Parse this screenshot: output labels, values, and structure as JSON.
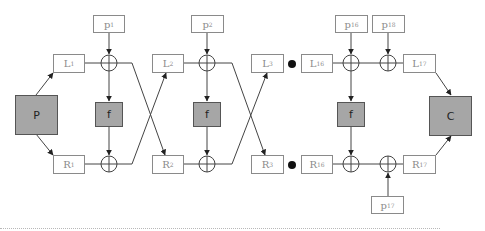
{
  "diagram": {
    "input_block": {
      "label": "P"
    },
    "output_block": {
      "label": "C"
    },
    "round_function": {
      "label": "f"
    },
    "rounds": [
      {
        "L": {
          "base": "L",
          "sub": "1"
        },
        "R": {
          "base": "R",
          "sub": "1"
        },
        "key": {
          "base": "p",
          "sub": "1"
        }
      },
      {
        "L": {
          "base": "L",
          "sub": "2"
        },
        "R": {
          "base": "R",
          "sub": "2"
        },
        "key": {
          "base": "p",
          "sub": "2"
        }
      },
      {
        "L": {
          "base": "L",
          "sub": "3"
        },
        "R": {
          "base": "R",
          "sub": "3"
        }
      },
      {
        "L": {
          "base": "L",
          "sub": "16"
        },
        "R": {
          "base": "R",
          "sub": "16"
        },
        "key": {
          "base": "p",
          "sub": "16"
        }
      },
      {
        "L": {
          "base": "L",
          "sub": "17"
        },
        "R": {
          "base": "R",
          "sub": "17"
        }
      }
    ],
    "final_keys": {
      "top": {
        "base": "p",
        "sub": "18"
      },
      "bottom": {
        "base": "p",
        "sub": "17"
      }
    },
    "ellipsis_marker": "dot",
    "colors": {
      "gray_box": "#a6a6a6",
      "line": "#444444",
      "label_border": "#8a8a8a"
    }
  }
}
